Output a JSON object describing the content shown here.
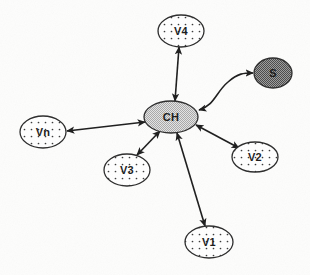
{
  "diagram": {
    "background_color": "#fdfdfc",
    "edge_color": "#1c1c1c",
    "nodes": [
      {
        "id": "ch",
        "label": "CH",
        "role": "cluster-head",
        "fill_style": "checker-light",
        "fill_color": "#cfcfcf",
        "stroke_color": "#2b2b2b",
        "cx": 171,
        "cy": 117,
        "rx": 27,
        "ry": 16
      },
      {
        "id": "v4",
        "label": "V4",
        "role": "member-node",
        "fill_style": "dotted",
        "fill_color": "#ffffff",
        "stroke_color": "#2b2b2b",
        "cx": 181,
        "cy": 31,
        "rx": 23,
        "ry": 16
      },
      {
        "id": "s",
        "label": "S",
        "role": "sink-node",
        "fill_style": "checker-dark",
        "fill_color": "#8a8a8a",
        "stroke_color": "#2b2b2b",
        "cx": 273,
        "cy": 73,
        "rx": 19,
        "ry": 15
      },
      {
        "id": "vn",
        "label": "Vn",
        "role": "member-node",
        "fill_style": "dotted",
        "fill_color": "#ffffff",
        "stroke_color": "#2b2b2b",
        "cx": 43,
        "cy": 132,
        "rx": 23,
        "ry": 16
      },
      {
        "id": "v3",
        "label": "V3",
        "role": "member-node",
        "fill_style": "dotted",
        "fill_color": "#ffffff",
        "stroke_color": "#2b2b2b",
        "cx": 127,
        "cy": 170,
        "rx": 23,
        "ry": 16
      },
      {
        "id": "v2",
        "label": "V2",
        "role": "member-node",
        "fill_style": "dotted",
        "fill_color": "#ffffff",
        "stroke_color": "#2b2b2b",
        "cx": 255,
        "cy": 157,
        "rx": 23,
        "ry": 15
      },
      {
        "id": "v1",
        "label": "V1",
        "role": "member-node",
        "fill_style": "dotted",
        "fill_color": "#ffffff",
        "stroke_color": "#2b2b2b",
        "cx": 209,
        "cy": 242,
        "rx": 24,
        "ry": 16
      }
    ],
    "edges": [
      {
        "id": "edge-ch-v4",
        "from": "ch",
        "to": "v4",
        "shape": "straight",
        "arrows": "both",
        "path": "M 175 101 L 179 47"
      },
      {
        "id": "edge-ch-s",
        "from": "ch",
        "to": "s",
        "shape": "curved",
        "arrows": "both",
        "path": "M 199 110 C 214 106 216 92 228 82 C 238 73 244 73 253 73"
      },
      {
        "id": "edge-ch-vn",
        "from": "ch",
        "to": "vn",
        "shape": "straight",
        "arrows": "both",
        "path": "M 145 122 L 67 131"
      },
      {
        "id": "edge-ch-v3",
        "from": "ch",
        "to": "v3",
        "shape": "straight",
        "arrows": "both",
        "path": "M 160 131 L 137 155"
      },
      {
        "id": "edge-ch-v1",
        "from": "ch",
        "to": "v1",
        "shape": "straight",
        "arrows": "both",
        "path": "M 177 133 L 205 226"
      },
      {
        "id": "edge-ch-v2",
        "from": "ch",
        "to": "v2",
        "shape": "straight",
        "arrows": "both",
        "path": "M 196 125 L 239 148"
      }
    ]
  }
}
